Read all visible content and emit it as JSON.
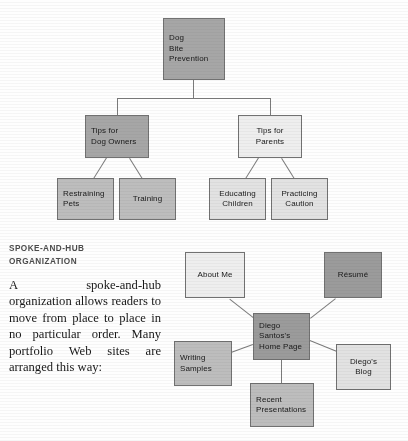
{
  "article": {
    "heading_line1": "SPOKE-AND-HUB",
    "heading_line2": "ORGANIZATION",
    "body": "A spoke-and-hub organization allows readers to move from place to place in no particular order. Many portfolio Web sites are arranged this way:"
  },
  "hierarchy_diagram": {
    "root": {
      "line1": "Dog",
      "line2": "Bite",
      "line3": "Prevention"
    },
    "branches": [
      {
        "line1": "Tips for",
        "line2": "Dog Owners",
        "children": [
          {
            "line1": "Restraining",
            "line2": "Pets"
          },
          {
            "line1": "Training",
            "line2": ""
          }
        ]
      },
      {
        "line1": "Tips for",
        "line2": "Parents",
        "children": [
          {
            "line1": "Educating",
            "line2": "Children"
          },
          {
            "line1": "Practicing",
            "line2": "Caution"
          }
        ]
      }
    ]
  },
  "hub_diagram": {
    "hub": {
      "line1": "Diego",
      "line2": "Santos's",
      "line3": "Home Page"
    },
    "spokes": [
      {
        "line1": "About Me",
        "line2": ""
      },
      {
        "line1": "Résumé",
        "line2": ""
      },
      {
        "line1": "Writing",
        "line2": "Samples"
      },
      {
        "line1": "Diego's",
        "line2": "Blog"
      },
      {
        "line1": "Recent",
        "line2": "Presentations"
      }
    ]
  },
  "colors": {
    "node_border": "#6f6f6f",
    "connector": "#7a7a7a",
    "fill_dark": "#a6a6a6",
    "fill_darker": "#9a9a9a",
    "fill_mid": "#bdbdbd",
    "fill_light": "#e3e3e3",
    "fill_pale": "#efefef",
    "heading": "#4a4a4a"
  }
}
